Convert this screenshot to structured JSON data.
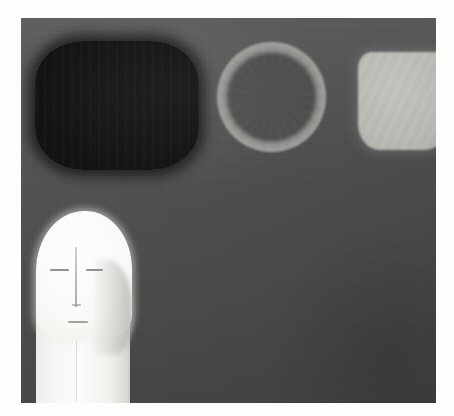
{
  "artwork": {
    "medium_appearance": "painting",
    "canvas": {
      "background_color": "#4c4c4c",
      "background_top_color": "#575757",
      "background_bottom_color": "#3e3e3e",
      "border_color": "#fdfdfc",
      "x": 21,
      "y": 18,
      "width": 415,
      "height": 385
    },
    "shapes": [
      {
        "name": "dark-rounded-rect",
        "description": "large near-black rounded rectangle, upper left",
        "color": "#131313",
        "x": 35,
        "y": 41,
        "width": 164,
        "height": 129
      },
      {
        "name": "light-ring",
        "description": "light gray annulus / ring with darker interior, upper center",
        "ring_color": "#a3a39f",
        "interior_color": "#4e4e4e",
        "x": 217,
        "y": 42,
        "width": 109,
        "height": 110
      },
      {
        "name": "pale-block",
        "description": "pale gray rounded block cropped by the right canvas edge",
        "color": "#bcbcb7",
        "x": 358,
        "y": 52,
        "width": 92,
        "height": 98
      },
      {
        "name": "white-head-figure",
        "description": "tall white stylized head and torso, cropped by the bottom canvas edge",
        "color": "#fbfbf9",
        "shadow_color": "#b0b0ac",
        "features": [
          "eye-left",
          "eye-right",
          "nose",
          "nose-tip",
          "mouth",
          "cheek-shadow",
          "neck-line"
        ],
        "x": 30,
        "y": 211,
        "width": 112,
        "height": 192
      }
    ]
  }
}
